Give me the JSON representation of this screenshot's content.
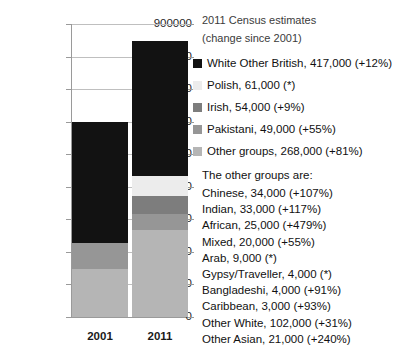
{
  "chart_data": {
    "type": "bar",
    "subtype": "stacked",
    "title": "",
    "xlabel": "",
    "ylabel": "",
    "categories": [
      "2001",
      "2011"
    ],
    "ylim": [
      0,
      900000
    ],
    "ytick_values": [
      0,
      100000,
      200000,
      300000,
      400000,
      500000,
      600000,
      700000,
      800000,
      900000
    ],
    "ytick_labels": [
      "0",
      "100000",
      "200000",
      "300000",
      "400000",
      "500000",
      "600000",
      "700000",
      "800000",
      "900000"
    ],
    "grid": true,
    "legend_position": "right",
    "series": [
      {
        "name": "Other groups",
        "color": "#b5b5b5",
        "values": [
          148000,
          268000
        ]
      },
      {
        "name": "Pakistani",
        "color": "#969696",
        "values": [
          80000,
          49000
        ]
      },
      {
        "name": "Irish",
        "color": "#7d7d7d",
        "values": [
          0,
          54000
        ]
      },
      {
        "name": "Polish",
        "color": "#ececec",
        "values": [
          0,
          61000
        ]
      },
      {
        "name": "White Other British",
        "color": "#121212",
        "values": [
          372000,
          417000
        ]
      }
    ],
    "totals": [
      600000,
      849000
    ],
    "stack_order_bottom_to_top": [
      "Other groups",
      "Pakistani",
      "Irish",
      "Polish",
      "White Other British"
    ]
  },
  "legend": {
    "heading_line1": "2011 Census estimates",
    "heading_line2": "(change since 2001)",
    "items": [
      {
        "label": "White Other British, 417,000 (+12%)",
        "color": "#121212"
      },
      {
        "label": "Polish, 61,000 (*)",
        "color": "#ececec"
      },
      {
        "label": "Irish, 54,000 (+9%)",
        "color": "#7d7d7d"
      },
      {
        "label": "Pakistani, 49,000 (+55%)",
        "color": "#969696"
      },
      {
        "label": "Other groups, 268,000 (+81%)",
        "color": "#b5b5b5"
      }
    ]
  },
  "other_groups": {
    "title": "The other groups are:",
    "rows": [
      "Chinese, 34,000 (+107%)",
      "Indian, 33,000 (+117%)",
      "African, 25,000 (+479%)",
      "Mixed, 20,000 (+55%)",
      "Arab, 9,000 (*)",
      "Gypsy/Traveller, 4,000 (*)",
      "Bangladeshi, 4,000 (+91%)",
      "Caribbean, 3,000 (+93%)",
      "Other White, 102,000 (+31%)",
      "Other Asian, 21,000 (+240%)"
    ]
  }
}
